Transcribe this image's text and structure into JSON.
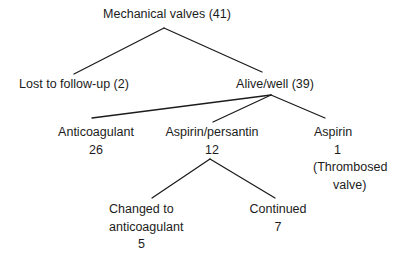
{
  "diagram": {
    "type": "tree",
    "colors": {
      "background": "#ffffff",
      "text": "#1c1c1c",
      "line": "#1c1c1c"
    },
    "nodes": {
      "root": {
        "label": "Mechanical valves (41)"
      },
      "lost": {
        "label": "Lost to follow-up (2)"
      },
      "alive": {
        "label": "Alive/well (39)"
      },
      "anticoagulant": {
        "label": "Anticoagulant",
        "count": "26"
      },
      "aspirin_persantin": {
        "label": "Aspirin/persantin",
        "count": "12"
      },
      "aspirin": {
        "label": "Aspirin",
        "count": "1",
        "note_line1": "(Thrombosed",
        "note_line2": "valve)"
      },
      "changed": {
        "label_line1": "Changed to",
        "label_line2": "anticoagulant",
        "count": "5"
      },
      "continued": {
        "label": "Continued",
        "count": "7"
      }
    },
    "edges": [
      {
        "from": "root",
        "to": "lost"
      },
      {
        "from": "root",
        "to": "alive"
      },
      {
        "from": "alive",
        "to": "anticoagulant"
      },
      {
        "from": "alive",
        "to": "aspirin_persantin"
      },
      {
        "from": "alive",
        "to": "aspirin"
      },
      {
        "from": "aspirin_persantin",
        "to": "changed"
      },
      {
        "from": "aspirin_persantin",
        "to": "continued"
      }
    ]
  }
}
